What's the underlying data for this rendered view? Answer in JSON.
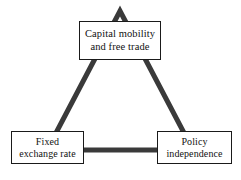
{
  "diagram": {
    "type": "triangle-diagram",
    "background_color": "#ffffff",
    "edge_color": "#3a3a3a",
    "box_border_color": "#1a1a1a",
    "text_color": "#111111",
    "nodes": [
      {
        "id": "capital-mobility",
        "position": "top",
        "lines": [
          "Capital mobility",
          "and free trade"
        ]
      },
      {
        "id": "fixed-exchange-rate",
        "position": "bottom-left",
        "lines": [
          "Fixed",
          "exchange rate"
        ]
      },
      {
        "id": "policy-independence",
        "position": "bottom-right",
        "lines": [
          "Policy",
          "independence"
        ]
      }
    ],
    "edges": [
      {
        "id": "apex-to-bottom-left",
        "from": "capital-mobility",
        "to": "fixed-exchange-rate"
      },
      {
        "id": "apex-to-bottom-right",
        "from": "capital-mobility",
        "to": "policy-independence"
      },
      {
        "id": "bottom-left-to-bottom-right",
        "from": "fixed-exchange-rate",
        "to": "policy-independence"
      }
    ]
  }
}
